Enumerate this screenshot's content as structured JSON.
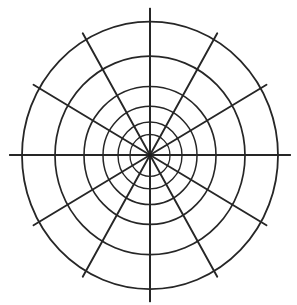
{
  "figure": {
    "kind": "polar-grid-diagram",
    "title": "",
    "background_color": "#ffffff",
    "stroke_color": "#262626"
  },
  "chart_data": {
    "type": "line",
    "title": "",
    "subtitle": "",
    "xlabel": "",
    "ylabel": "",
    "grid": true,
    "legend": "none",
    "projection": "polar",
    "center": {
      "x": 150,
      "y": 155
    },
    "radial_gridlines": {
      "count": 6,
      "radii_px": [
        20,
        32,
        47,
        66,
        95,
        128
      ],
      "labels": []
    },
    "angular_gridlines": {
      "count": 12,
      "step_degrees": 30,
      "angles_degrees": [
        0,
        30,
        60,
        90,
        120,
        150,
        180,
        210,
        240,
        270,
        300,
        330
      ],
      "labels": []
    },
    "center_marker": {
      "visible": true,
      "radius_px": 2
    },
    "series": [],
    "annotations": []
  },
  "elements": {
    "center_dot_name": "polar-center-point",
    "outer_circle_name": "outer-grid-circle",
    "axis_horizontal_name": "horizontal-axis-spoke",
    "axis_vertical_name": "vertical-axis-spoke"
  }
}
